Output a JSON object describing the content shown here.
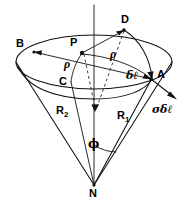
{
  "figure": {
    "kind": "geometry-diagram",
    "background_color": "#ffffff",
    "line_color": "#111111"
  },
  "labels": {
    "point_b": "B",
    "point_p": "P",
    "point_c": "C",
    "point_d": "D",
    "point_a": "A",
    "point_n": "N",
    "rho_left": "ρ",
    "rho_right": "ρ",
    "delta_l": "δℓ",
    "sigma_delta_l": "σδℓ",
    "radius_1": "R",
    "radius_1_sub": "1",
    "radius_2": "R",
    "radius_2_sub": "2",
    "phi": "ϕ"
  },
  "geometry": {
    "axis": {
      "x": 94,
      "y_top": 5,
      "y_bottom": 186
    },
    "apex_n": {
      "x": 94,
      "y": 185
    },
    "top_ellipse": {
      "cx": 94,
      "cy": 62,
      "rx": 78,
      "ry": 27
    },
    "inner_ellipse": {
      "cx": 94,
      "cy": 70,
      "rx": 57,
      "ry": 22
    },
    "points": {
      "B": {
        "x": 33,
        "y": 50
      },
      "P": {
        "x": 82,
        "y": 52
      },
      "C": {
        "x": 71,
        "y": 81
      },
      "D": {
        "x": 124,
        "y": 29
      },
      "A": {
        "x": 151,
        "y": 79
      }
    },
    "sigma_arrow": {
      "from_x": 151,
      "from_y": 79,
      "to_x": 176,
      "to_y": 99
    },
    "phi_arc_radius": 40
  }
}
